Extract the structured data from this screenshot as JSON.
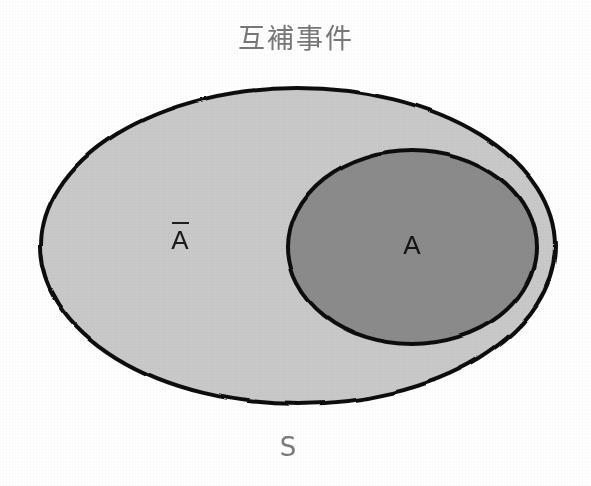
{
  "figure": {
    "title": "互補事件",
    "background_color": "#ffffff",
    "width": 591,
    "height": 486
  },
  "labels": {
    "complement": {
      "text": "A",
      "has_overline": true,
      "reading": "A-bar",
      "color": "#1a1a1a"
    },
    "event": {
      "text": "A",
      "color": "#141414"
    },
    "sample_space": {
      "text": "S",
      "color": "#7a7a7a"
    }
  },
  "shapes": {
    "outer_ellipse": {
      "name": "sample-space-region",
      "cx": 298,
      "cy": 246,
      "rx": 257,
      "ry": 158,
      "fill": "#c9c9c9",
      "stroke": "#111111",
      "stroke_width": 4
    },
    "inner_ellipse": {
      "name": "event-a-region",
      "cx": 412,
      "cy": 247,
      "rx": 124,
      "ry": 97,
      "fill": "#8b8b8b",
      "stroke": "#111111",
      "stroke_width": 4
    }
  },
  "chart_data": {
    "type": "diagram",
    "diagram_kind": "venn",
    "title": "互補事件",
    "regions": [
      {
        "id": "S",
        "label": "S",
        "description": "sample space / universal set",
        "shape": "ellipse",
        "fill": "#c9c9c9"
      },
      {
        "id": "A",
        "label": "A",
        "description": "event A",
        "shape": "ellipse",
        "fill": "#8b8b8b"
      },
      {
        "id": "A-bar",
        "label": "Ā",
        "description": "complement of A within S",
        "shape": "ellipse-difference",
        "fill": "#c9c9c9"
      }
    ]
  }
}
